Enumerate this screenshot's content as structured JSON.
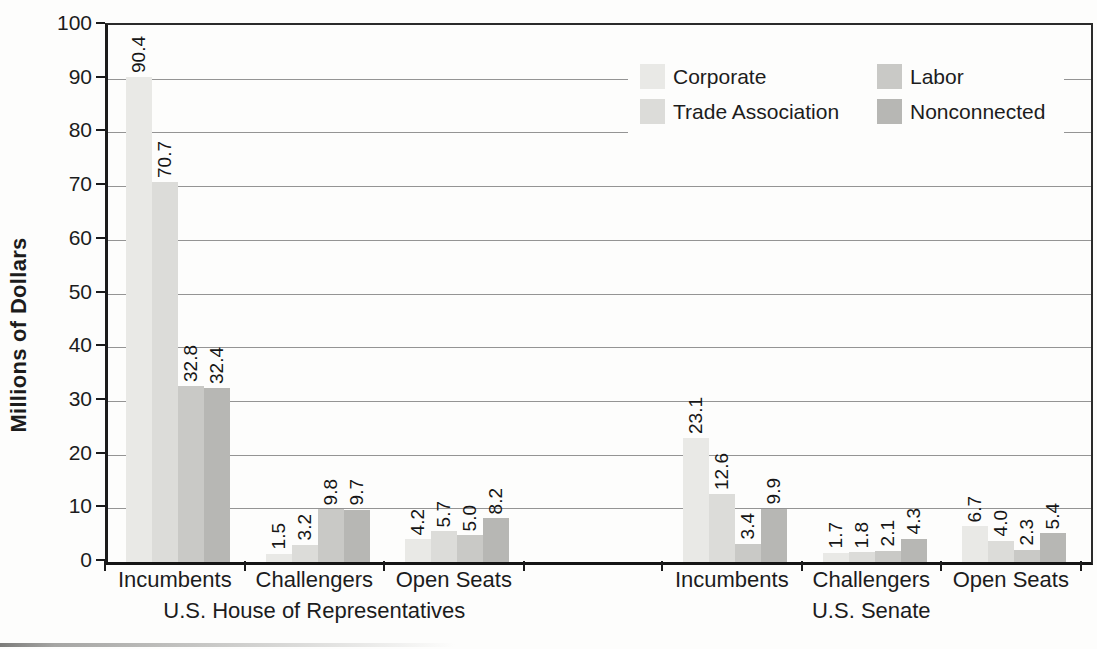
{
  "chart_data": {
    "type": "bar",
    "title": "",
    "ylabel": "Millions of Dollars",
    "xlabel": "",
    "ylim": [
      0,
      100
    ],
    "yticks": [
      0,
      10,
      20,
      30,
      40,
      50,
      60,
      70,
      80,
      90,
      100
    ],
    "grid": true,
    "legend_position": "top-right",
    "value_label_format": "one-decimal",
    "value_label_orientation": "vertical-bottom-to-top",
    "series_names": [
      "Corporate",
      "Trade Association",
      "Labor",
      "Nonconnected"
    ],
    "series_colors": [
      "#e9e9e6",
      "#dcdcd9",
      "#c9c9c6",
      "#b7b7b4"
    ],
    "legend_entries": [
      {
        "label": "Corporate",
        "color": "#e9e9e6"
      },
      {
        "label": "Trade Association",
        "color": "#dcdcd9"
      },
      {
        "label": "Labor",
        "color": "#c9c9c6"
      },
      {
        "label": "Nonconnected",
        "color": "#b7b7b4"
      }
    ],
    "sections": [
      {
        "label": "U.S. House of Representatives",
        "groups": [
          {
            "category": "Incumbents",
            "values": [
              90.4,
              70.7,
              32.8,
              32.4
            ]
          },
          {
            "category": "Challengers",
            "values": [
              1.5,
              3.2,
              9.8,
              9.7
            ]
          },
          {
            "category": "Open Seats",
            "values": [
              4.2,
              5.7,
              5.0,
              8.2
            ]
          }
        ]
      },
      {
        "label": "U.S. Senate",
        "groups": [
          {
            "category": "Incumbents",
            "values": [
              23.1,
              12.6,
              3.4,
              9.9
            ]
          },
          {
            "category": "Challengers",
            "values": [
              1.7,
              1.8,
              2.1,
              4.3
            ]
          },
          {
            "category": "Open Seats",
            "values": [
              6.7,
              4.0,
              2.3,
              5.4
            ]
          }
        ]
      }
    ],
    "axis_color": "#1b1b1b",
    "gridline_color": "#949494",
    "text_color": "#1c1c1c"
  }
}
